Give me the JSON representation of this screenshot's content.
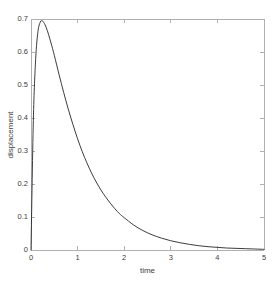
{
  "chart_data": {
    "type": "line",
    "title": "",
    "xlabel": "time",
    "ylabel": "displacement",
    "xlim": [
      0,
      5
    ],
    "ylim": [
      0,
      0.7
    ],
    "xticks": [
      "0",
      "1",
      "2",
      "3",
      "4",
      "5"
    ],
    "xtick_values": [
      0,
      1,
      2,
      3,
      4,
      5
    ],
    "yticks": [
      "0",
      "0.1",
      "0.2",
      "0.3",
      "0.4",
      "0.5",
      "0.6",
      "0.7"
    ],
    "ytick_values": [
      0,
      0.1,
      0.2,
      0.3,
      0.4,
      0.5,
      0.6,
      0.7
    ],
    "grid": false,
    "legend": null,
    "line_color": "#262626",
    "axis_color": "#b0b0b0",
    "background_color": "#ffffff",
    "series": [
      {
        "name": "displacement",
        "x": [
          0,
          0.05,
          0.1,
          0.15,
          0.2,
          0.23,
          0.25,
          0.3,
          0.35,
          0.4,
          0.45,
          0.5,
          0.6,
          0.7,
          0.8,
          0.9,
          1.0,
          1.1,
          1.2,
          1.3,
          1.4,
          1.5,
          1.6,
          1.7,
          1.8,
          1.9,
          2.0,
          2.2,
          2.4,
          2.6,
          2.8,
          3.0,
          3.2,
          3.4,
          3.6,
          3.8,
          4.0,
          4.2,
          4.4,
          4.6,
          4.8,
          5.0
        ],
        "y": [
          0.0,
          0.392,
          0.578,
          0.663,
          0.691,
          0.695,
          0.694,
          0.683,
          0.665,
          0.642,
          0.617,
          0.59,
          0.533,
          0.478,
          0.427,
          0.38,
          0.337,
          0.298,
          0.264,
          0.233,
          0.206,
          0.182,
          0.161,
          0.142,
          0.125,
          0.11,
          0.098,
          0.076,
          0.059,
          0.046,
          0.036,
          0.028,
          0.022,
          0.017,
          0.013,
          0.01,
          0.008,
          0.006,
          0.005,
          0.004,
          0.003,
          0.002
        ]
      }
    ],
    "annotations": []
  },
  "figure": {
    "plot_box": {
      "left": 31,
      "top": 19,
      "right": 264,
      "bottom": 250
    }
  }
}
